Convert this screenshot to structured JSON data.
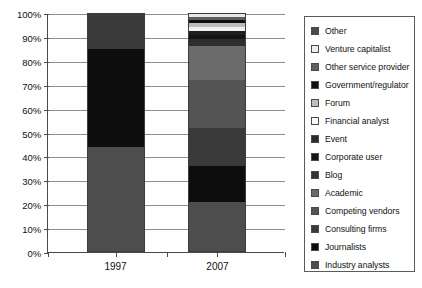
{
  "chart_data": {
    "type": "bar",
    "subtype": "stacked-100-percent",
    "title": "",
    "xlabel": "",
    "ylabel": "",
    "ylim": [
      0,
      100
    ],
    "ytick_labels": [
      "0%",
      "10%",
      "20%",
      "30%",
      "40%",
      "50%",
      "60%",
      "70%",
      "80%",
      "90%",
      "100%"
    ],
    "ytick_values": [
      0,
      10,
      20,
      30,
      40,
      50,
      60,
      70,
      80,
      90,
      100
    ],
    "grid": true,
    "legend_position": "right",
    "categories": [
      "1997",
      "2007"
    ],
    "series": [
      {
        "name": "Industry analysts",
        "color": "#4d4d4d",
        "values": [
          44,
          21
        ]
      },
      {
        "name": "Journalists",
        "color": "#0d0d0d",
        "values": [
          41,
          15
        ]
      },
      {
        "name": "Consulting firms",
        "color": "#3a3a3a",
        "values": [
          15,
          16
        ]
      },
      {
        "name": "Competing vendors",
        "color": "#545454",
        "values": [
          0,
          20
        ]
      },
      {
        "name": "Academic",
        "color": "#6b6b6b",
        "values": [
          0,
          14
        ]
      },
      {
        "name": "Blog",
        "color": "#2e2e2e",
        "values": [
          0,
          3
        ]
      },
      {
        "name": "Corporate user",
        "color": "#141414",
        "values": [
          0,
          2
        ]
      },
      {
        "name": "Event",
        "color": "#1f1f1f",
        "values": [
          0,
          1.5
        ]
      },
      {
        "name": "Financial analyst",
        "color": "#f2f2f2",
        "values": [
          0,
          1.5
        ]
      },
      {
        "name": "Forum",
        "color": "#bdbdbd",
        "values": [
          0,
          2
        ]
      },
      {
        "name": "Government/regulator",
        "color": "#101010",
        "values": [
          0,
          1.2
        ]
      },
      {
        "name": "Other service provider",
        "color": "#5e5e5e",
        "values": [
          0,
          1.3
        ]
      },
      {
        "name": "Venture capitalist",
        "color": "#e8e8e8",
        "values": [
          0,
          0.9
        ]
      },
      {
        "name": "Other",
        "color": "#4a4a4a",
        "values": [
          0,
          0.6
        ]
      }
    ]
  },
  "legend": {
    "items": [
      {
        "label": "Other",
        "color": "#4a4a4a"
      },
      {
        "label": "Venture capitalist",
        "color": "#ededed"
      },
      {
        "label": "Other service provider",
        "color": "#5e5e5e"
      },
      {
        "label": "Government/regulator",
        "color": "#111111"
      },
      {
        "label": "Forum",
        "color": "#bdbdbd"
      },
      {
        "label": "Financial analyst",
        "color": "#fbfbfb"
      },
      {
        "label": "Event",
        "color": "#2a2a2a"
      },
      {
        "label": "Corporate user",
        "color": "#151515"
      },
      {
        "label": "Blog",
        "color": "#333333"
      },
      {
        "label": "Academic",
        "color": "#6b6b6b"
      },
      {
        "label": "Competing vendors",
        "color": "#545454"
      },
      {
        "label": "Consulting firms",
        "color": "#3a3a3a"
      },
      {
        "label": "Journalists",
        "color": "#0d0d0d"
      },
      {
        "label": "Industry analysts",
        "color": "#4d4d4d"
      }
    ]
  }
}
